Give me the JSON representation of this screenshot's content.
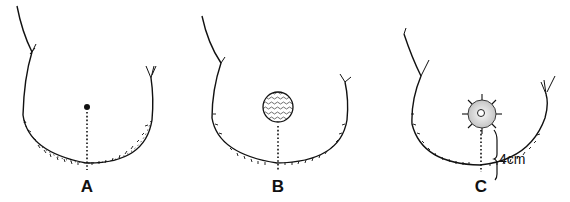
{
  "panels": [
    {
      "id": "A",
      "label": "A",
      "center_marker": "dot"
    },
    {
      "id": "B",
      "label": "B",
      "center_marker": "hatched-disc"
    },
    {
      "id": "C",
      "label": "C",
      "center_marker": "sutured-disc",
      "measurement": "4cm"
    }
  ],
  "colors": {
    "ink": "#111111",
    "background": "#ffffff",
    "shade": "#cfcfcf"
  }
}
